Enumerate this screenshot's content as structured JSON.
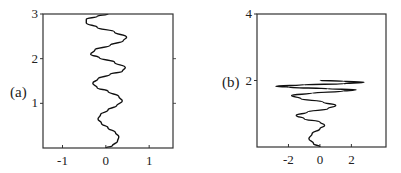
{
  "chart_data": [
    {
      "type": "line",
      "panel_label": "(a)",
      "title": "",
      "xlabel": "",
      "ylabel": "",
      "xlim": [
        -1.45,
        1.55
      ],
      "ylim": [
        0,
        3
      ],
      "x_ticks": [
        -1,
        0,
        1
      ],
      "x_tick_labels": [
        "-1",
        "0",
        "1"
      ],
      "y_ticks": [
        1,
        2,
        3
      ],
      "y_tick_labels": [
        "1",
        "2",
        "3"
      ],
      "right_ticks": [
        1,
        2
      ],
      "grid": false,
      "series": [
        {
          "name": "profile-a",
          "points": [
            [
              0.0,
              0.0
            ],
            [
              0.15,
              0.05
            ],
            [
              0.27,
              0.15
            ],
            [
              0.3,
              0.25
            ],
            [
              0.22,
              0.35
            ],
            [
              0.05,
              0.45
            ],
            [
              -0.1,
              0.55
            ],
            [
              -0.18,
              0.65
            ],
            [
              -0.12,
              0.75
            ],
            [
              0.05,
              0.85
            ],
            [
              0.25,
              0.95
            ],
            [
              0.38,
              1.05
            ],
            [
              0.3,
              1.15
            ],
            [
              0.05,
              1.27
            ],
            [
              -0.2,
              1.35
            ],
            [
              -0.3,
              1.45
            ],
            [
              -0.18,
              1.55
            ],
            [
              0.1,
              1.65
            ],
            [
              0.38,
              1.72
            ],
            [
              0.45,
              1.8
            ],
            [
              0.2,
              1.92
            ],
            [
              -0.15,
              2.02
            ],
            [
              -0.35,
              2.1
            ],
            [
              -0.25,
              2.2
            ],
            [
              0.1,
              2.3
            ],
            [
              0.4,
              2.4
            ],
            [
              0.48,
              2.48
            ],
            [
              0.2,
              2.6
            ],
            [
              -0.2,
              2.7
            ],
            [
              -0.45,
              2.8
            ],
            [
              -0.45,
              2.88
            ],
            [
              -0.2,
              2.95
            ],
            [
              0.05,
              3.0
            ]
          ]
        }
      ]
    },
    {
      "type": "line",
      "panel_label": "(b)",
      "title": "",
      "xlabel": "",
      "ylabel": "",
      "xlim": [
        -4,
        4.2
      ],
      "ylim": [
        0,
        4
      ],
      "x_ticks": [
        -2,
        0,
        2
      ],
      "x_tick_labels": [
        "-2",
        "0",
        "2"
      ],
      "y_ticks": [
        2,
        4
      ],
      "y_tick_labels": [
        "2",
        "4"
      ],
      "grid": false,
      "series": [
        {
          "name": "profile-b",
          "points": [
            [
              0.0,
              0.0
            ],
            [
              -0.4,
              0.1
            ],
            [
              -0.7,
              0.25
            ],
            [
              -0.5,
              0.4
            ],
            [
              0.0,
              0.55
            ],
            [
              0.3,
              0.65
            ],
            [
              0.0,
              0.75
            ],
            [
              -1.0,
              0.85
            ],
            [
              -1.5,
              0.95
            ],
            [
              -0.8,
              1.05
            ],
            [
              0.5,
              1.15
            ],
            [
              1.0,
              1.25
            ],
            [
              0.2,
              1.35
            ],
            [
              -1.2,
              1.45
            ],
            [
              -1.8,
              1.55
            ],
            [
              -0.5,
              1.62
            ],
            [
              1.5,
              1.68
            ],
            [
              2.3,
              1.72
            ],
            [
              0.5,
              1.75
            ],
            [
              -2.0,
              1.8
            ],
            [
              -2.8,
              1.83
            ],
            [
              -1.0,
              1.87
            ],
            [
              1.5,
              1.9
            ],
            [
              2.8,
              1.95
            ],
            [
              1.5,
              1.98
            ],
            [
              0.0,
              2.0
            ]
          ]
        }
      ]
    }
  ]
}
